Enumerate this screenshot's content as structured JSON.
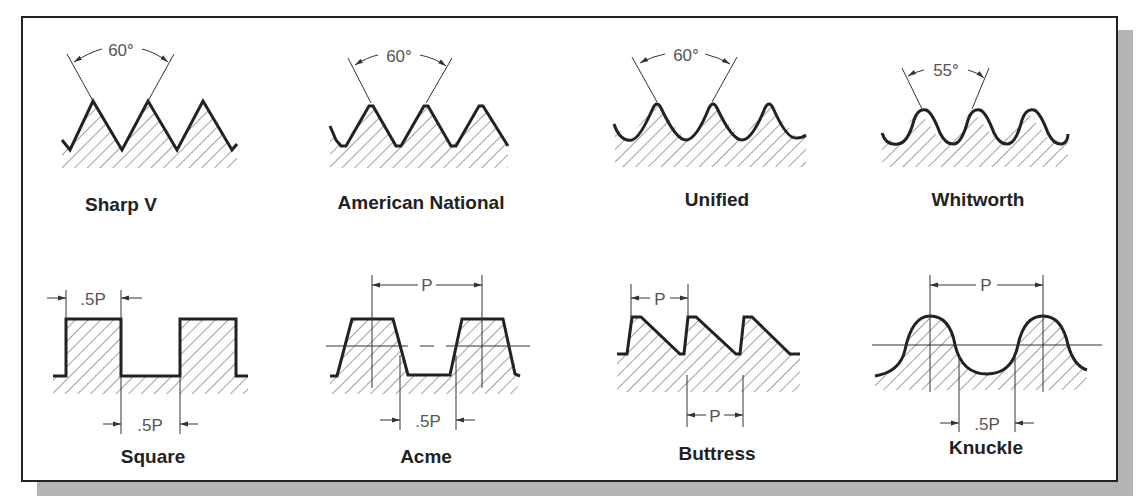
{
  "figure": {
    "border_color": "#222222",
    "shadow_color": "#b4b4b4",
    "line_color": "#222222",
    "dimension_color": "#555555"
  },
  "thread_forms": [
    {
      "name": "Sharp V",
      "angle_label": "60°",
      "row": 1
    },
    {
      "name": "American National",
      "angle_label": "60°",
      "row": 1
    },
    {
      "name": "Unified",
      "angle_label": "60°",
      "row": 1
    },
    {
      "name": "Whitworth",
      "angle_label": "55°",
      "row": 1
    },
    {
      "name": "Square",
      "dimensions": [
        ".5P",
        ".5P"
      ],
      "row": 2
    },
    {
      "name": "Acme",
      "dimensions": [
        "P",
        ".5P"
      ],
      "row": 2
    },
    {
      "name": "Buttress",
      "dimensions": [
        "P",
        "P"
      ],
      "row": 2
    },
    {
      "name": "Knuckle",
      "dimensions": [
        "P",
        ".5P"
      ],
      "row": 2
    }
  ]
}
